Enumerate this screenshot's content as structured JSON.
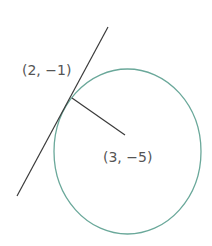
{
  "diagram": {
    "colors": {
      "circle_stroke": "#6aa89a",
      "line_stroke": "#3a3a3a",
      "label_text": "#555555",
      "background": "#ffffff"
    },
    "tangent_point": {
      "label": "(2, −1)",
      "x": 2,
      "y": -1
    },
    "center": {
      "label": "(3, −5)",
      "x": 3,
      "y": -5
    },
    "elements": {
      "circle": "circle",
      "tangent_line": "tangent line",
      "radius": "radius"
    }
  }
}
